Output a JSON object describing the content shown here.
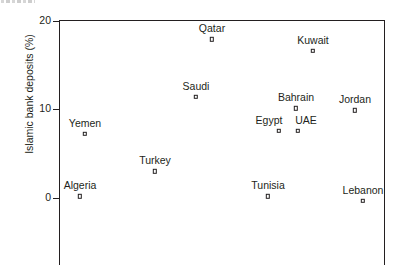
{
  "chart_data": {
    "type": "scatter",
    "title": "",
    "xlabel": "",
    "ylabel": "Islamic bank deposits (%)",
    "ylim": [
      -2.5,
      20
    ],
    "yticks": [
      0,
      10,
      20
    ],
    "ytick_labels": [
      "0",
      "10",
      "20"
    ],
    "grid": false,
    "legend": "none",
    "x_axis_visible": false,
    "points": [
      {
        "label": "Qatar",
        "x": 212,
        "y": 17.9
      },
      {
        "label": "Kuwait",
        "x": 313,
        "y": 16.6
      },
      {
        "label": "Saudi",
        "x": 196,
        "y": 11.4
      },
      {
        "label": "Bahrain",
        "x": 296,
        "y": 10.1
      },
      {
        "label": "Jordan",
        "x": 355,
        "y": 9.9
      },
      {
        "label": "Egypt",
        "x": 279,
        "y": 7.6
      },
      {
        "label": "UAE",
        "x": 298,
        "y": 7.6
      },
      {
        "label": "Yemen",
        "x": 85,
        "y": 7.2
      },
      {
        "label": "Turkey",
        "x": 155,
        "y": 3.0
      },
      {
        "label": "Algeria",
        "x": 80,
        "y": 0.2
      },
      {
        "label": "Tunisia",
        "x": 268,
        "y": 0.2
      },
      {
        "label": "Lebanon",
        "x": 363,
        "y": -0.3
      }
    ]
  },
  "axis": {
    "y_title": "Islamic bank deposits (%)",
    "ticks": [
      {
        "value": 20,
        "text": "20"
      },
      {
        "value": 10,
        "text": "10"
      },
      {
        "value": 0,
        "text": "0"
      }
    ]
  }
}
